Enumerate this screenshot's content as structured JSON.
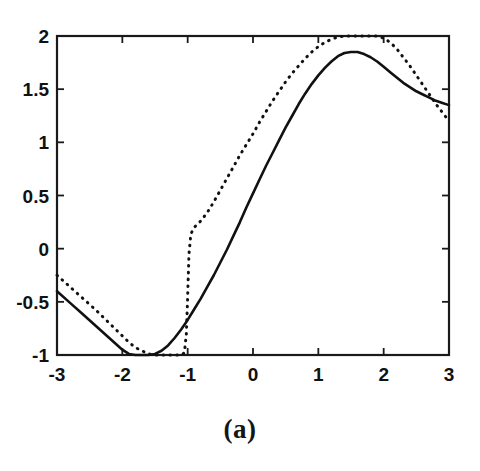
{
  "figure": {
    "caption": "(a)",
    "background_color": "#ffffff",
    "ink_color": "#111111"
  },
  "chart_data": {
    "type": "line",
    "title": "",
    "subtitle": "",
    "xlabel": "",
    "ylabel": "",
    "xlim": [
      -3,
      3
    ],
    "ylim": [
      -1,
      2
    ],
    "grid": false,
    "legend": null,
    "legend_position": "none",
    "xticks": [
      -3,
      -2,
      -1,
      0,
      1,
      2,
      3
    ],
    "xtick_labels": [
      "-3",
      "-2",
      "-1",
      "0",
      "1",
      "2",
      "3"
    ],
    "yticks": [
      -1,
      -0.5,
      0,
      0.5,
      1,
      1.5,
      2
    ],
    "ytick_labels": [
      "-1",
      "-0.5",
      "0",
      "0.5",
      "1",
      "1.5",
      "2"
    ],
    "tick_direction": "in",
    "box_frame": true,
    "annotations": [],
    "series": [
      {
        "name": "solid-curve",
        "style": "solid",
        "color": "#111111",
        "x": [
          -3.0,
          -2.8,
          -2.6,
          -2.4,
          -2.2,
          -2.0,
          -1.9,
          -1.8,
          -1.7,
          -1.6,
          -1.5,
          -1.4,
          -1.3,
          -1.2,
          -1.1,
          -1.0,
          -0.9,
          -0.8,
          -0.7,
          -0.6,
          -0.5,
          -0.4,
          -0.3,
          -0.2,
          -0.1,
          0.0,
          0.1,
          0.2,
          0.3,
          0.4,
          0.5,
          0.6,
          0.7,
          0.8,
          0.9,
          1.0,
          1.1,
          1.2,
          1.3,
          1.4,
          1.5,
          1.6,
          1.7,
          1.8,
          1.9,
          2.0,
          2.1,
          2.2,
          2.3,
          2.4,
          2.5,
          2.6,
          2.7,
          2.8,
          2.9,
          3.0
        ],
        "y": [
          -0.4,
          -0.51,
          -0.62,
          -0.73,
          -0.84,
          -0.95,
          -0.99,
          -1.0,
          -1.0,
          -1.0,
          -0.99,
          -0.96,
          -0.91,
          -0.84,
          -0.76,
          -0.67,
          -0.57,
          -0.47,
          -0.36,
          -0.25,
          -0.13,
          -0.01,
          0.12,
          0.25,
          0.39,
          0.52,
          0.65,
          0.78,
          0.9,
          1.02,
          1.14,
          1.25,
          1.36,
          1.46,
          1.55,
          1.63,
          1.7,
          1.76,
          1.81,
          1.84,
          1.85,
          1.85,
          1.83,
          1.8,
          1.76,
          1.71,
          1.66,
          1.61,
          1.56,
          1.52,
          1.48,
          1.45,
          1.42,
          1.39,
          1.37,
          1.35
        ]
      },
      {
        "name": "dotted-curve",
        "style": "dotted",
        "color": "#111111",
        "x": [
          -3.0,
          -2.8,
          -2.6,
          -2.4,
          -2.2,
          -2.0,
          -1.9,
          -1.8,
          -1.7,
          -1.6,
          -1.5,
          -1.4,
          -1.3,
          -1.2,
          -1.1,
          -1.05,
          -1.02,
          -1.0,
          -0.98,
          -0.95,
          -0.9,
          -0.8,
          -0.7,
          -0.6,
          -0.5,
          -0.4,
          -0.3,
          -0.2,
          -0.1,
          0.0,
          0.1,
          0.2,
          0.3,
          0.4,
          0.5,
          0.6,
          0.7,
          0.8,
          0.9,
          1.0,
          1.1,
          1.2,
          1.3,
          1.4,
          1.5,
          1.6,
          1.7,
          1.8,
          1.9,
          2.0,
          2.1,
          2.2,
          2.3,
          2.4,
          2.5,
          2.6,
          2.7,
          2.8,
          2.9,
          3.0
        ],
        "y": [
          -0.25,
          -0.36,
          -0.47,
          -0.58,
          -0.7,
          -0.82,
          -0.88,
          -0.93,
          -0.96,
          -0.99,
          -1.0,
          -1.0,
          -1.0,
          -1.0,
          -1.0,
          -0.98,
          -0.8,
          -0.45,
          -0.05,
          0.14,
          0.2,
          0.26,
          0.34,
          0.44,
          0.55,
          0.66,
          0.77,
          0.88,
          0.98,
          1.08,
          1.19,
          1.29,
          1.39,
          1.48,
          1.57,
          1.65,
          1.72,
          1.79,
          1.85,
          1.9,
          1.94,
          1.97,
          1.99,
          2.0,
          2.0,
          2.0,
          2.0,
          2.0,
          2.0,
          1.98,
          1.94,
          1.88,
          1.8,
          1.72,
          1.63,
          1.54,
          1.45,
          1.36,
          1.28,
          1.2
        ]
      }
    ]
  }
}
